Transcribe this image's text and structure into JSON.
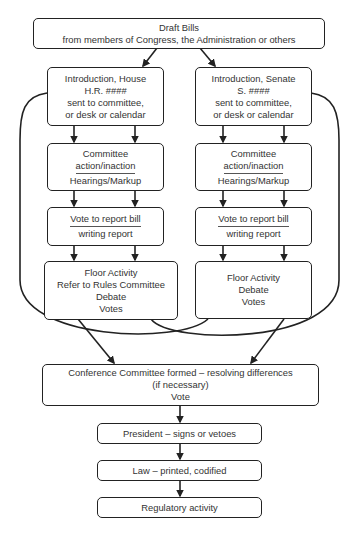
{
  "diagram": {
    "draft": {
      "line1": "Draft Bills",
      "line2": "from members of Congress, the Administration or others"
    },
    "house": {
      "intro": [
        "Introduction, House",
        "H.R. ####",
        "sent to committee,",
        "or desk or calendar"
      ],
      "committee": [
        "Committee",
        "action/inaction",
        "Hearings/Markup"
      ],
      "vote": [
        "Vote to report bill",
        "writing report"
      ],
      "floor": [
        "Floor Activity",
        "Refer to Rules Committee",
        "Debate",
        "Votes"
      ]
    },
    "senate": {
      "intro": [
        "Introduction, Senate",
        "S. ####",
        "sent to committee,",
        "or desk or calendar"
      ],
      "committee": [
        "Committee",
        "action/inaction",
        "Hearings/Markup"
      ],
      "vote": [
        "Vote to report bill",
        "writing report"
      ],
      "floor": [
        "Floor Activity",
        "Debate",
        "Votes"
      ]
    },
    "conference": [
      "Conference Committee formed – resolving differences",
      "(if necessary)",
      "Vote"
    ],
    "president": "President – signs or vetoes",
    "law": "Law – printed, codified",
    "regulatory": "Regulatory activity"
  },
  "colors": {
    "stroke": "#222222",
    "text": "#333333",
    "background": "#ffffff"
  }
}
